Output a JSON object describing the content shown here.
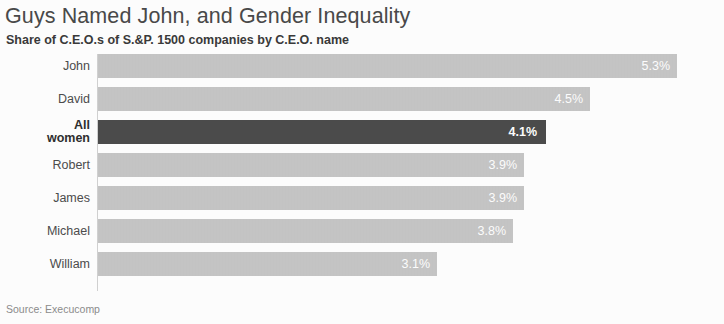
{
  "chart_data": {
    "type": "bar",
    "orientation": "horizontal",
    "title": "Guys Named John, and Gender Inequality",
    "subtitle": "Share of C.E.O.s of S.&P. 1500 companies by C.E.O. name",
    "xlabel": "",
    "ylabel": "",
    "xlim": [
      0,
      5.6
    ],
    "grid": false,
    "legend": null,
    "source": "Source: Execucomp",
    "categories": [
      "John",
      "David",
      "All\nwomen",
      "Robert",
      "James",
      "Michael",
      "William"
    ],
    "values": [
      5.3,
      4.5,
      4.1,
      3.9,
      3.9,
      3.8,
      3.1
    ],
    "value_labels": [
      "5.3%",
      "4.5%",
      "4.1%",
      "3.9%",
      "3.9%",
      "3.8%",
      "3.1%"
    ],
    "highlight_index": 2,
    "colors": {
      "bar": "#c6c6c6",
      "bar_highlight": "#4c4c4c",
      "value_text": "#ffffff",
      "title": "#4a4a4a",
      "subtitle": "#3a3a3a",
      "category_label": "#4d4d4d",
      "source": "#8d8d8d",
      "axis": "#d2d2d2",
      "background": "#ffffff"
    },
    "bars": [
      {
        "category": "John",
        "value": 5.3,
        "label": "5.3%",
        "highlight": false,
        "multiline": false
      },
      {
        "category": "David",
        "value": 4.5,
        "label": "4.5%",
        "highlight": false,
        "multiline": false
      },
      {
        "category": "All\nwomen",
        "value": 4.1,
        "label": "4.1%",
        "highlight": true,
        "multiline": true
      },
      {
        "category": "Robert",
        "value": 3.9,
        "label": "3.9%",
        "highlight": false,
        "multiline": false
      },
      {
        "category": "James",
        "value": 3.9,
        "label": "3.9%",
        "highlight": false,
        "multiline": false
      },
      {
        "category": "Michael",
        "value": 3.8,
        "label": "3.8%",
        "highlight": false,
        "multiline": false
      },
      {
        "category": "William",
        "value": 3.1,
        "label": "3.1%",
        "highlight": false,
        "multiline": false
      }
    ]
  }
}
